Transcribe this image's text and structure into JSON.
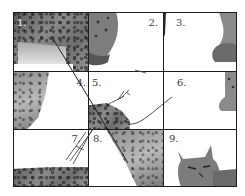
{
  "figure": {
    "grid": {
      "rows": 3,
      "columns": 3
    },
    "tiles": [
      {
        "number": "1.",
        "row": 1,
        "col": 1,
        "content": "spotted fur of lynx body"
      },
      {
        "number": "2.",
        "row": 1,
        "col": 2,
        "content": "lynx leg / paw"
      },
      {
        "number": "3.",
        "row": 1,
        "col": 3,
        "content": "lynx paw at right edge"
      },
      {
        "number": "4.",
        "row": 2,
        "col": 1,
        "content": "lynx fur on left side"
      },
      {
        "number": "5.",
        "row": 2,
        "col": 2,
        "content": "lynx back with stroke lines"
      },
      {
        "number": "6.",
        "row": 2,
        "col": 3,
        "content": "lynx paw at right edge"
      },
      {
        "number": "7.",
        "row": 3,
        "col": 1,
        "content": "fur strip along bottom"
      },
      {
        "number": "8.",
        "row": 3,
        "col": 2,
        "content": "lynx chest fur"
      },
      {
        "number": "9.",
        "row": 3,
        "col": 3,
        "content": "lynx head"
      }
    ]
  },
  "colors": {
    "grid_line": "#1e1e1e",
    "label": "#3a3a3a",
    "label_light": "#f2f2f2",
    "background": "#ffffff"
  }
}
